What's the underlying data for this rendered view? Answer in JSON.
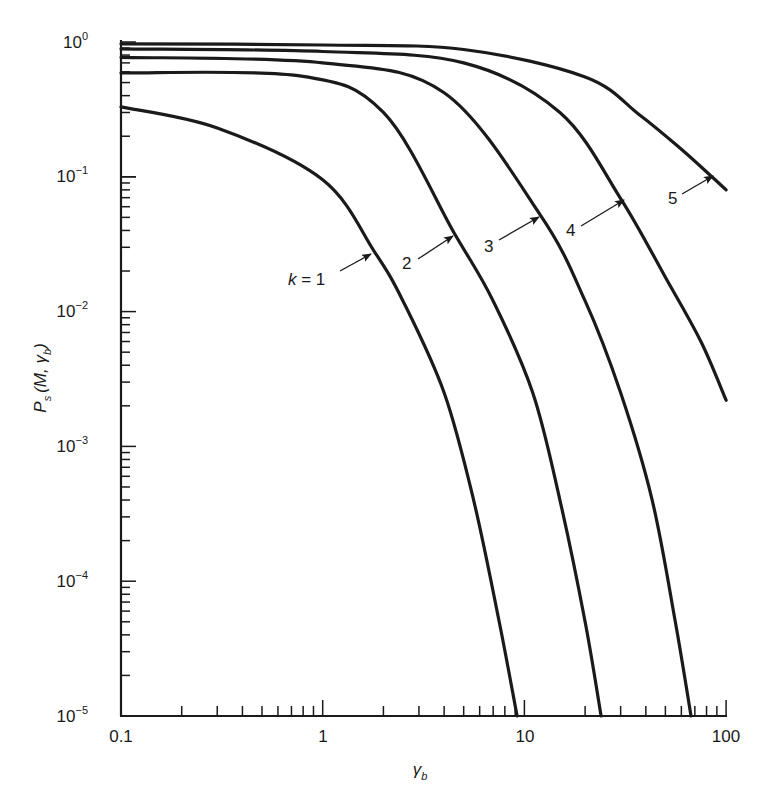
{
  "chart_data": {
    "type": "line",
    "title": "",
    "xlabel": "γ_b",
    "ylabel": "P_s(M, γ_b)",
    "xscale": "log",
    "yscale": "log",
    "xlim": [
      0.1,
      100
    ],
    "ylim": [
      1e-05,
      1
    ],
    "grid": false,
    "x_tick_labels": [
      "0.1",
      "1",
      "10",
      "100"
    ],
    "y_tick_labels": [
      {
        "base": "10",
        "exp": "0"
      },
      {
        "base": "10",
        "exp": "−1"
      },
      {
        "base": "10",
        "exp": "−2"
      },
      {
        "base": "10",
        "exp": "−3"
      },
      {
        "base": "10",
        "exp": "−4"
      },
      {
        "base": "10",
        "exp": "−5"
      }
    ],
    "legend": "inline arrows on curves",
    "series": [
      {
        "name": "k = 1",
        "label": "k = 1",
        "x": [
          0.1,
          0.3,
          1,
          1.8,
          2.5,
          4,
          5.6,
          7.5,
          9.2
        ],
        "y": [
          0.33,
          0.23,
          0.095,
          0.028,
          0.012,
          0.0025,
          0.0004,
          5e-05,
          1e-05
        ]
      },
      {
        "name": "k = 2",
        "label": "2",
        "x": [
          0.1,
          0.77,
          2,
          4.5,
          7.0,
          11,
          15,
          20,
          24
        ],
        "y": [
          0.59,
          0.56,
          0.3,
          0.038,
          0.012,
          0.0025,
          0.0004,
          5e-05,
          1e-05
        ]
      },
      {
        "name": "k = 3",
        "label": "3",
        "x": [
          0.1,
          1,
          4,
          12,
          20,
          30,
          43,
          56,
          67
        ],
        "y": [
          0.77,
          0.7,
          0.42,
          0.052,
          0.012,
          0.0025,
          0.0004,
          5e-05,
          1e-05
        ]
      },
      {
        "name": "k = 4",
        "label": "4",
        "x": [
          0.1,
          1,
          5,
          15,
          30,
          50,
          75,
          100
        ],
        "y": [
          0.89,
          0.85,
          0.7,
          0.3,
          0.069,
          0.018,
          0.006,
          0.0022
        ]
      },
      {
        "name": "k = 5",
        "label": "5",
        "x": [
          0.1,
          1,
          5,
          20,
          37,
          60,
          85,
          100
        ],
        "y": [
          0.97,
          0.95,
          0.88,
          0.55,
          0.29,
          0.16,
          0.1,
          0.08
        ]
      }
    ],
    "annotations": [
      {
        "text": "k = 1",
        "arrow_to": [
          1.8,
          0.028
        ]
      },
      {
        "text": "2",
        "arrow_to": [
          4.5,
          0.038
        ]
      },
      {
        "text": "3",
        "arrow_to": [
          12,
          0.052
        ]
      },
      {
        "text": "4",
        "arrow_to": [
          30,
          0.069
        ]
      },
      {
        "text": "5",
        "arrow_to": [
          85,
          0.092
        ]
      }
    ]
  },
  "axes": {
    "x_label_main": "γ",
    "x_label_sub": "b",
    "y_label_main": "P",
    "y_label_sub": "s",
    "y_label_args": "(M, γ",
    "y_label_args_sub": "b",
    "y_label_close": ")"
  },
  "labels": {
    "k1": "k = 1",
    "k2": "2",
    "k3": "3",
    "k4": "4",
    "k5": "5"
  },
  "ticks": {
    "x": [
      "0.1",
      "1",
      "10",
      "100"
    ],
    "y_base": "10",
    "y_exp": [
      "0",
      "−1",
      "−2",
      "−3",
      "−4",
      "−5"
    ]
  }
}
